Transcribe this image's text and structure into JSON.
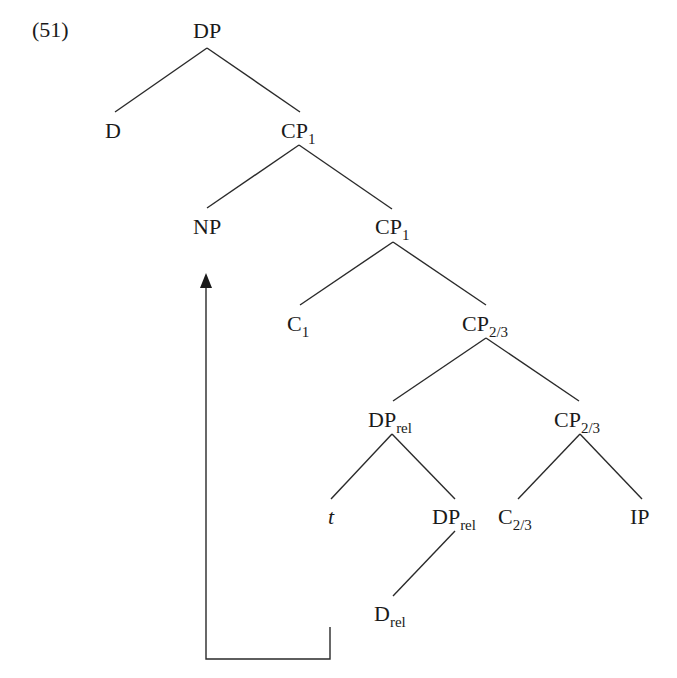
{
  "example_number": "(51)",
  "tree": {
    "nodes": [
      {
        "id": "dp_root",
        "cat": "DP",
        "sub": "",
        "x": 193,
        "y": 20
      },
      {
        "id": "d",
        "cat": "D",
        "sub": "",
        "x": 105,
        "y": 120
      },
      {
        "id": "cp1_a",
        "cat": "CP",
        "sub": "1",
        "x": 281,
        "y": 120
      },
      {
        "id": "np",
        "cat": "NP",
        "sub": "",
        "x": 193,
        "y": 216
      },
      {
        "id": "cp1_b",
        "cat": "CP",
        "sub": "1",
        "x": 375,
        "y": 216
      },
      {
        "id": "c1",
        "cat": "C",
        "sub": "1",
        "x": 287,
        "y": 313
      },
      {
        "id": "cp23_a",
        "cat": "CP",
        "sub": "2/3",
        "x": 462,
        "y": 313
      },
      {
        "id": "dprel_a",
        "cat": "DP",
        "sub": "rel",
        "x": 368,
        "y": 409
      },
      {
        "id": "cp23_b",
        "cat": "CP",
        "sub": "2/3",
        "x": 554,
        "y": 409
      },
      {
        "id": "t",
        "cat": "t",
        "sub": "",
        "x": 328,
        "y": 506,
        "italic": true
      },
      {
        "id": "dprel_b",
        "cat": "DP",
        "sub": "rel",
        "x": 432,
        "y": 506
      },
      {
        "id": "c23",
        "cat": "C",
        "sub": "2/3",
        "x": 498,
        "y": 506
      },
      {
        "id": "ip",
        "cat": "IP",
        "sub": "",
        "x": 630,
        "y": 506
      },
      {
        "id": "drel",
        "cat": "D",
        "sub": "rel",
        "x": 374,
        "y": 603
      }
    ],
    "edges": [
      {
        "from": "dp_root",
        "to": "d",
        "x1": 207,
        "y1": 48,
        "x2": 115,
        "y2": 112
      },
      {
        "from": "dp_root",
        "to": "cp1_a",
        "x1": 207,
        "y1": 48,
        "x2": 300,
        "y2": 112
      },
      {
        "from": "cp1_a",
        "to": "np",
        "x1": 299,
        "y1": 145,
        "x2": 207,
        "y2": 208
      },
      {
        "from": "cp1_a",
        "to": "cp1_b",
        "x1": 299,
        "y1": 145,
        "x2": 392,
        "y2": 209
      },
      {
        "from": "cp1_b",
        "to": "c1",
        "x1": 393,
        "y1": 242,
        "x2": 300,
        "y2": 305
      },
      {
        "from": "cp1_b",
        "to": "cp23_a",
        "x1": 393,
        "y1": 242,
        "x2": 486,
        "y2": 305
      },
      {
        "from": "cp23_a",
        "to": "dprel_a",
        "x1": 486,
        "y1": 338,
        "x2": 393,
        "y2": 401
      },
      {
        "from": "cp23_a",
        "to": "cp23_b",
        "x1": 486,
        "y1": 338,
        "x2": 579,
        "y2": 401
      },
      {
        "from": "dprel_a",
        "to": "t",
        "x1": 392,
        "y1": 434,
        "x2": 331,
        "y2": 499
      },
      {
        "from": "dprel_a",
        "to": "dprel_b",
        "x1": 392,
        "y1": 434,
        "x2": 455,
        "y2": 499
      },
      {
        "from": "cp23_b",
        "to": "c23",
        "x1": 580,
        "y1": 434,
        "x2": 518,
        "y2": 499
      },
      {
        "from": "cp23_b",
        "to": "ip",
        "x1": 580,
        "y1": 434,
        "x2": 642,
        "y2": 499
      },
      {
        "from": "dprel_b",
        "to": "drel",
        "x1": 455,
        "y1": 531,
        "x2": 393,
        "y2": 596
      }
    ],
    "movement_arrow": {
      "from": "drel",
      "to": "np",
      "points": "330,627 330,659 206,659 206,287",
      "head": "206,273 200,288 212,288"
    }
  }
}
